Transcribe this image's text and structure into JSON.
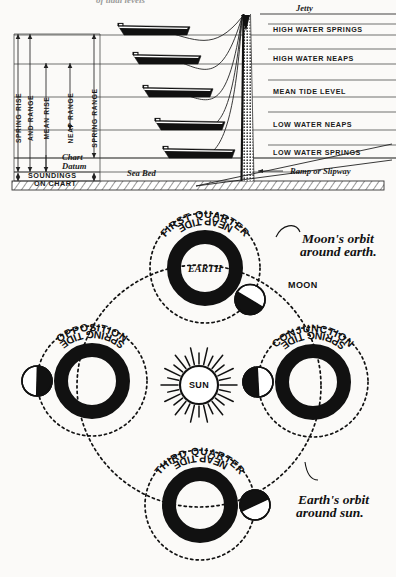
{
  "page": {
    "title_fragment": "of tidal levels",
    "bg_color": "#fbfaf8",
    "ink_color": "#111111"
  },
  "tide_diagram": {
    "name": "tidal-levels-diagram",
    "jetty_label": "Jetty",
    "sea_bed_label": "Sea Bed",
    "chart_datum_label_line1": "Chart",
    "chart_datum_label_line2": "Datum",
    "soundings_label_line1": "SOUNDINGS",
    "soundings_label_line2": "ON CHART",
    "ramp_label": "Ramp or Slipway",
    "levels": [
      {
        "label": "HIGH WATER SPRINGS",
        "y": 35
      },
      {
        "label": "HIGH WATER NEAPS",
        "y": 64
      },
      {
        "label": "MEAN TIDE LEVEL",
        "y": 97
      },
      {
        "label": "LOW WATER NEAPS",
        "y": 130
      },
      {
        "label": "LOW WATER SPRINGS",
        "y": 158
      }
    ],
    "range_bars": [
      {
        "label": "SPRING RISE",
        "x": 18
      },
      {
        "label": "AND RANGE",
        "x": 30
      },
      {
        "label": "MEAN RISE",
        "x": 46
      },
      {
        "label": "NEAP RANGE",
        "x": 70
      },
      {
        "label": "SPRING RANGE",
        "x": 94
      }
    ],
    "boat_count": 5
  },
  "moon_diagram": {
    "name": "spring-neap-tide-orbit-diagram",
    "sun_label": "SUN",
    "earth_label": "EARTH",
    "moon_label": "MOON",
    "moon_orbit_note_line1": "Moon's orbit",
    "moon_orbit_note_line2": "around earth.",
    "earth_orbit_note_line1": "Earth's orbit",
    "earth_orbit_note_line2": "around sun.",
    "positions": [
      {
        "id": "first-quarter",
        "phase_label": "FIRST QUARTER",
        "tide_label": "NEAP TIDE",
        "cx": 205,
        "cy": 268,
        "moon_angle": 35
      },
      {
        "id": "opposition",
        "phase_label": "OPPOSITION",
        "tide_label": "SPRING TIDE",
        "cx": 92,
        "cy": 381,
        "moon_angle": 180
      },
      {
        "id": "conjunction",
        "phase_label": "CONJUNCTION",
        "tide_label": "SPRING TIDE",
        "cx": 313,
        "cy": 382,
        "moon_angle": 180
      },
      {
        "id": "third-quarter",
        "phase_label": "THIRD QUARTER",
        "tide_label": "NEAP TIDE",
        "cx": 200,
        "cy": 505,
        "moon_angle": 0
      }
    ]
  }
}
